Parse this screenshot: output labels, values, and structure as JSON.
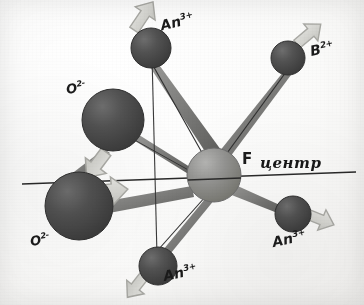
{
  "figure": {
    "background_color": "#fbfbfa",
    "axis_line_color": "#2a2a2a"
  },
  "palette": {
    "anion_dark": "#4a4a4a",
    "anion_dark_edge": "#2e2e2e",
    "cation_dark": "#565656",
    "center_gray": "#8d8d8d",
    "center_gray_edge": "#6d6d6d",
    "bond_gray": "#7b7b7b",
    "arrow_light": "#d7d7d3",
    "arrow_edge": "#a9a9a4",
    "label_ink": "#1b1b1b"
  },
  "labels": [
    {
      "id": "an-top",
      "element": "An",
      "charge": "3+",
      "text": "An3+",
      "x": 160,
      "y": 14,
      "rotate": -14
    },
    {
      "id": "b-right",
      "element": "B",
      "charge": "2+",
      "text": "B2+",
      "x": 310,
      "y": 41,
      "rotate": -12
    },
    {
      "id": "o-upper",
      "element": "O",
      "charge": "2-",
      "text": "O2-",
      "x": 66,
      "y": 81,
      "rotate": -10
    },
    {
      "id": "o-lower",
      "element": "O",
      "charge": "2-",
      "text": "O2-",
      "x": 30,
      "y": 233,
      "rotate": -10
    },
    {
      "id": "an-bottom",
      "element": "An",
      "charge": "3+",
      "text": "An3+",
      "x": 163,
      "y": 265,
      "rotate": -12
    },
    {
      "id": "an-right",
      "element": "An",
      "charge": "3+",
      "text": "An3+",
      "x": 272,
      "y": 231,
      "rotate": -12
    }
  ],
  "center": {
    "symbol": "F",
    "annotation": "центр",
    "symbol_x": 242,
    "symbol_y": 152,
    "annotation_x": 260,
    "annotation_y": 154
  },
  "atoms": [
    {
      "id": "f-center",
      "species": "F",
      "role": "vacancy-center",
      "cx": 214,
      "cy": 175,
      "r": 27,
      "shade": "center"
    },
    {
      "id": "o-upper",
      "species": "O2-",
      "role": "anion",
      "cx": 113,
      "cy": 120,
      "r": 31,
      "shade": "dark"
    },
    {
      "id": "o-lower",
      "species": "O2-",
      "role": "anion",
      "cx": 79,
      "cy": 206,
      "r": 34,
      "shade": "dark"
    },
    {
      "id": "an-top",
      "species": "An3+",
      "role": "cation",
      "cx": 151,
      "cy": 48,
      "r": 20,
      "shade": "dark"
    },
    {
      "id": "b-right",
      "species": "B2+",
      "role": "cation",
      "cx": 288,
      "cy": 58,
      "r": 17,
      "shade": "dark"
    },
    {
      "id": "an-right",
      "species": "An3+",
      "role": "cation",
      "cx": 293,
      "cy": 214,
      "r": 18,
      "shade": "dark"
    },
    {
      "id": "an-bottom",
      "species": "An3+",
      "role": "cation",
      "cx": 158,
      "cy": 266,
      "r": 19,
      "shade": "dark"
    }
  ],
  "bonds": [
    {
      "id": "bond-f-an-top",
      "from": "f-center",
      "to": "an-top"
    },
    {
      "id": "bond-f-b-right",
      "from": "f-center",
      "to": "b-right"
    },
    {
      "id": "bond-f-an-right",
      "from": "f-center",
      "to": "an-right"
    },
    {
      "id": "bond-f-an-bottom",
      "from": "f-center",
      "to": "an-bottom"
    },
    {
      "id": "bond-f-o-upper",
      "from": "f-center",
      "to": "o-upper"
    },
    {
      "id": "bond-f-o-lower",
      "from": "f-center",
      "to": "o-lower"
    },
    {
      "id": "bond-o-upper-o-lower",
      "from": "o-upper",
      "to": "o-lower"
    }
  ],
  "displacement_arrows": [
    {
      "id": "arrow-an-top",
      "at": "an-top",
      "direction": "up-left",
      "angle": -58
    },
    {
      "id": "arrow-b-right",
      "at": "b-right",
      "direction": "up-right",
      "angle": -38
    },
    {
      "id": "arrow-an-right",
      "at": "an-right",
      "direction": "right-down",
      "angle": 26
    },
    {
      "id": "arrow-an-bottom",
      "at": "an-bottom",
      "direction": "down-left",
      "angle": 118
    },
    {
      "id": "arrow-o-upper",
      "at": "o-upper",
      "direction": "down-left",
      "angle": 126
    },
    {
      "id": "arrow-o-lower",
      "at": "o-lower",
      "direction": "right",
      "angle": -4
    }
  ],
  "axis": {
    "id": "horizontal-axis",
    "x1": 22,
    "y1": 184,
    "x2": 356,
    "y2": 172
  },
  "vertical_guide": {
    "id": "vertical-guide",
    "x1": 152,
    "y1": 56,
    "x2": 157,
    "y2": 256
  }
}
